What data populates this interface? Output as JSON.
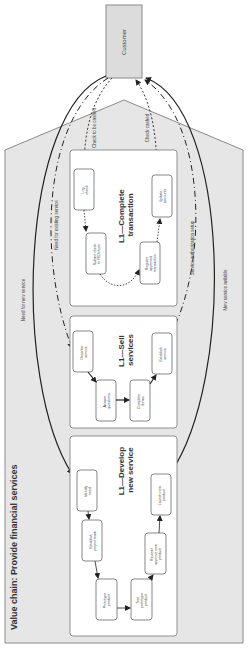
{
  "diagram": {
    "title": "Value chain:  Provide financial services",
    "customer": "Customer",
    "colors": {
      "background": "#ffffff",
      "chevron_fill": "#e6e6e6",
      "chevron_stroke": "#8a8a8a",
      "panel_fill": "#ffffff",
      "panel_stroke": "#777777",
      "customer_fill": "#dcdcdc",
      "line": "#222222"
    },
    "flow_labels": {
      "need_new": "Need for new service",
      "need_existing": "Need for existing service",
      "check_to_cash": "Check to be cashed",
      "check_cashed": "Check cashed",
      "auth_setup": "Service authorization setup",
      "service_available": "New service avilable"
    },
    "panels": [
      {
        "heading": [
          "L1—Complete",
          "transaction"
        ],
        "steps": [
          [
            "Log",
            "check"
          ],
          [
            "Submit check",
            "to FEDchurn"
          ],
          [
            "Register",
            "approved",
            "transaction"
          ],
          [
            "Update",
            "accounts"
          ]
        ]
      },
      {
        "heading": [
          "L1—Sell",
          "services"
        ],
        "steps": [
          [
            "Describe",
            "service"
          ],
          [
            "Answer",
            "questions"
          ],
          [
            "Complete",
            "forms"
          ],
          [
            "Establish",
            "service"
          ]
        ]
      },
      {
        "heading": [
          "L1—Develop",
          "new service"
        ],
        "steps": [
          [
            "Identify",
            "need"
          ],
          [
            "Establish",
            "project team"
          ],
          [
            "Prototype",
            "product"
          ],
          [
            "Test",
            "prototype",
            "product"
          ],
          [
            "Review/",
            "approve new",
            "product"
          ],
          [
            "Launch new",
            "product"
          ]
        ]
      }
    ]
  }
}
